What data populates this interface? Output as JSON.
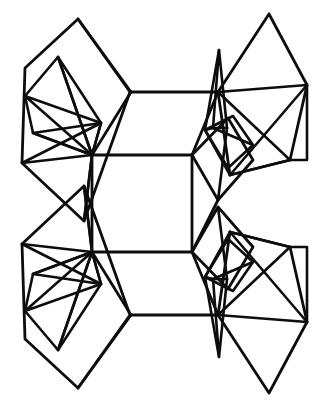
{
  "figure": {
    "kind": "line-drawing",
    "width": 326,
    "height": 407,
    "background_color": "#ffffff",
    "line_color": "#0d0d0d",
    "default_stroke_width": 2.6,
    "symmetry": "two-fold, mirrored about the horizontal mid-line y=203",
    "caption": ""
  },
  "chart_data": {
    "type": "line",
    "title": "",
    "xlabel": "",
    "ylabel": "",
    "grid": false,
    "legend": "none",
    "xlim": [
      0,
      326
    ],
    "ylim": [
      0,
      407
    ],
    "note": "Wireframe drawing: each series is one polyline of the structure, coordinates in image pixel space (y increases downward).",
    "series": [
      {
        "name": "top-left-outer-polyhedron",
        "width": 2.8,
        "points": [
          [
            78,
            19
          ],
          [
            25,
            68
          ],
          [
            22,
            163
          ],
          [
            84,
            221
          ],
          [
            130,
            92
          ],
          [
            78,
            19
          ]
        ]
      },
      {
        "name": "top-left-upper-face",
        "width": 2.8,
        "points": [
          [
            78,
            19
          ],
          [
            131,
            92
          ]
        ]
      },
      {
        "name": "top-left-inner-left-lobe",
        "width": 2.6,
        "points": [
          [
            58,
            57
          ],
          [
            25,
            96
          ],
          [
            33,
            133
          ],
          [
            92,
            155
          ],
          [
            101,
            123
          ],
          [
            58,
            57
          ]
        ]
      },
      {
        "name": "top-left-inner-diagonal-a",
        "width": 2.6,
        "points": [
          [
            25,
            96
          ],
          [
            101,
            123
          ],
          [
            92,
            155
          ],
          [
            25,
            96
          ]
        ]
      },
      {
        "name": "top-left-cross-brace-1",
        "width": 2.6,
        "points": [
          [
            58,
            57
          ],
          [
            92,
            155
          ]
        ]
      },
      {
        "name": "top-left-cross-brace-2",
        "width": 2.6,
        "points": [
          [
            33,
            133
          ],
          [
            101,
            123
          ]
        ]
      },
      {
        "name": "top-left-lower-web-1",
        "width": 2.6,
        "points": [
          [
            22,
            163
          ],
          [
            101,
            123
          ]
        ]
      },
      {
        "name": "top-left-lower-web-2",
        "width": 2.6,
        "points": [
          [
            33,
            133
          ],
          [
            92,
            155
          ],
          [
            84,
            221
          ]
        ]
      },
      {
        "name": "top-left-lower-web-3",
        "width": 2.6,
        "points": [
          [
            22,
            163
          ],
          [
            92,
            155
          ]
        ]
      },
      {
        "name": "top-left-stem",
        "width": 2.6,
        "points": [
          [
            58,
            57
          ],
          [
            92,
            155
          ],
          [
            84,
            221
          ]
        ]
      },
      {
        "name": "central-cavity-top-edge",
        "width": 2.8,
        "points": [
          [
            131,
            92
          ],
          [
            218,
            92
          ]
        ]
      },
      {
        "name": "central-cavity-left-upper",
        "width": 2.8,
        "points": [
          [
            131,
            92
          ],
          [
            92,
            155
          ]
        ]
      },
      {
        "name": "central-cavity-mid-edge",
        "width": 2.8,
        "points": [
          [
            92,
            155
          ],
          [
            192,
            155
          ]
        ]
      },
      {
        "name": "central-cavity-right-upper",
        "width": 2.8,
        "points": [
          [
            218,
            92
          ],
          [
            192,
            155
          ]
        ]
      },
      {
        "name": "central-cavity-left-lower",
        "width": 2.8,
        "points": [
          [
            92,
            252
          ],
          [
            131,
            315
          ]
        ]
      },
      {
        "name": "central-cavity-mid-edge-lower",
        "width": 2.8,
        "points": [
          [
            92,
            252
          ],
          [
            192,
            252
          ]
        ]
      },
      {
        "name": "central-cavity-right-lower",
        "width": 2.8,
        "points": [
          [
            192,
            252
          ],
          [
            218,
            315
          ]
        ]
      },
      {
        "name": "central-cavity-bottom-edge",
        "width": 2.8,
        "points": [
          [
            131,
            315
          ],
          [
            218,
            315
          ]
        ]
      },
      {
        "name": "central-cavity-left-wall",
        "width": 2.8,
        "points": [
          [
            92,
            155
          ],
          [
            92,
            252
          ]
        ]
      },
      {
        "name": "central-cavity-right-wall",
        "width": 2.8,
        "points": [
          [
            192,
            155
          ],
          [
            192,
            252
          ]
        ]
      },
      {
        "name": "top-right-outer-polyhedron",
        "width": 2.8,
        "points": [
          [
            269,
            14
          ],
          [
            218,
            92
          ],
          [
            230,
            175
          ],
          [
            290,
            160
          ],
          [
            307,
            85
          ],
          [
            269,
            14
          ]
        ]
      },
      {
        "name": "top-right-spike",
        "width": 2.6,
        "points": [
          [
            213,
            128
          ],
          [
            219,
            50
          ],
          [
            227,
            128
          ]
        ]
      },
      {
        "name": "top-right-spike-base",
        "width": 2.6,
        "points": [
          [
            213,
            128
          ],
          [
            227,
            128
          ]
        ]
      },
      {
        "name": "top-right-spike-foot",
        "width": 2.6,
        "points": [
          [
            219,
            50
          ],
          [
            205,
            130
          ],
          [
            213,
            128
          ]
        ]
      },
      {
        "name": "top-right-fan-1",
        "width": 2.6,
        "points": [
          [
            218,
            92
          ],
          [
            307,
            85
          ]
        ]
      },
      {
        "name": "top-right-fan-2",
        "width": 2.6,
        "points": [
          [
            218,
            92
          ],
          [
            290,
            160
          ]
        ]
      },
      {
        "name": "top-right-fan-3",
        "width": 2.6,
        "points": [
          [
            307,
            85
          ],
          [
            230,
            175
          ]
        ]
      },
      {
        "name": "top-right-fan-4",
        "width": 2.6,
        "points": [
          [
            307,
            85
          ],
          [
            307,
            160
          ],
          [
            290,
            160
          ]
        ]
      },
      {
        "name": "top-right-inner-rhomb",
        "width": 2.6,
        "points": [
          [
            205,
            130
          ],
          [
            233,
            116
          ],
          [
            253,
            145
          ],
          [
            228,
            168
          ],
          [
            205,
            130
          ]
        ]
      },
      {
        "name": "top-right-inner-brace",
        "width": 2.6,
        "points": [
          [
            213,
            128
          ],
          [
            253,
            145
          ]
        ]
      },
      {
        "name": "top-right-lower-rhomb",
        "width": 2.8,
        "points": [
          [
            192,
            155
          ],
          [
            228,
            118
          ],
          [
            253,
            160
          ],
          [
            218,
            200
          ],
          [
            192,
            155
          ]
        ]
      },
      {
        "name": "top-right-lower-brace-1",
        "width": 2.6,
        "points": [
          [
            227,
            128
          ],
          [
            218,
            200
          ]
        ]
      },
      {
        "name": "top-right-lower-brace-2",
        "width": 2.6,
        "points": [
          [
            205,
            130
          ],
          [
            230,
            175
          ]
        ]
      },
      {
        "name": "top-right-down-leg",
        "width": 2.8,
        "points": [
          [
            218,
            200
          ],
          [
            192,
            252
          ]
        ]
      },
      {
        "name": "top-right-long-diagonal",
        "width": 2.8,
        "points": [
          [
            290,
            160
          ],
          [
            230,
            175
          ]
        ]
      },
      {
        "name": "bottom-left-outer-polyhedron",
        "width": 2.8,
        "points": [
          [
            78,
            388
          ],
          [
            25,
            339
          ],
          [
            22,
            244
          ],
          [
            84,
            186
          ],
          [
            130,
            315
          ],
          [
            78,
            388
          ]
        ]
      },
      {
        "name": "bottom-left-upper-face",
        "width": 2.8,
        "points": [
          [
            78,
            388
          ],
          [
            131,
            315
          ]
        ]
      },
      {
        "name": "bottom-left-inner-left-lobe",
        "width": 2.6,
        "points": [
          [
            58,
            350
          ],
          [
            25,
            311
          ],
          [
            33,
            274
          ],
          [
            92,
            252
          ],
          [
            101,
            284
          ],
          [
            58,
            350
          ]
        ]
      },
      {
        "name": "bottom-left-inner-diagonal-a",
        "width": 2.6,
        "points": [
          [
            25,
            311
          ],
          [
            101,
            284
          ],
          [
            92,
            252
          ],
          [
            25,
            311
          ]
        ]
      },
      {
        "name": "bottom-left-cross-brace-1",
        "width": 2.6,
        "points": [
          [
            58,
            350
          ],
          [
            92,
            252
          ]
        ]
      },
      {
        "name": "bottom-left-cross-brace-2",
        "width": 2.6,
        "points": [
          [
            33,
            274
          ],
          [
            101,
            284
          ]
        ]
      },
      {
        "name": "bottom-left-lower-web-1",
        "width": 2.6,
        "points": [
          [
            22,
            244
          ],
          [
            101,
            284
          ]
        ]
      },
      {
        "name": "bottom-left-lower-web-2",
        "width": 2.6,
        "points": [
          [
            33,
            274
          ],
          [
            92,
            252
          ],
          [
            84,
            186
          ]
        ]
      },
      {
        "name": "bottom-left-lower-web-3",
        "width": 2.6,
        "points": [
          [
            22,
            244
          ],
          [
            92,
            252
          ]
        ]
      },
      {
        "name": "bottom-left-stem",
        "width": 2.6,
        "points": [
          [
            58,
            350
          ],
          [
            92,
            252
          ],
          [
            84,
            186
          ]
        ]
      },
      {
        "name": "bottom-right-outer-polyhedron",
        "width": 2.8,
        "points": [
          [
            269,
            393
          ],
          [
            218,
            315
          ],
          [
            230,
            232
          ],
          [
            290,
            247
          ],
          [
            307,
            322
          ],
          [
            269,
            393
          ]
        ]
      },
      {
        "name": "bottom-right-spike",
        "width": 2.6,
        "points": [
          [
            213,
            279
          ],
          [
            219,
            357
          ],
          [
            227,
            279
          ]
        ]
      },
      {
        "name": "bottom-right-spike-base",
        "width": 2.6,
        "points": [
          [
            213,
            279
          ],
          [
            227,
            279
          ]
        ]
      },
      {
        "name": "bottom-right-spike-foot",
        "width": 2.6,
        "points": [
          [
            219,
            357
          ],
          [
            205,
            277
          ],
          [
            213,
            279
          ]
        ]
      },
      {
        "name": "bottom-right-fan-1",
        "width": 2.6,
        "points": [
          [
            218,
            315
          ],
          [
            307,
            322
          ]
        ]
      },
      {
        "name": "bottom-right-fan-2",
        "width": 2.6,
        "points": [
          [
            218,
            315
          ],
          [
            290,
            247
          ]
        ]
      },
      {
        "name": "bottom-right-fan-3",
        "width": 2.6,
        "points": [
          [
            307,
            322
          ],
          [
            230,
            232
          ]
        ]
      },
      {
        "name": "bottom-right-fan-4",
        "width": 2.6,
        "points": [
          [
            307,
            322
          ],
          [
            307,
            247
          ],
          [
            290,
            247
          ]
        ]
      },
      {
        "name": "bottom-right-inner-rhomb",
        "width": 2.6,
        "points": [
          [
            205,
            277
          ],
          [
            233,
            291
          ],
          [
            253,
            262
          ],
          [
            228,
            239
          ],
          [
            205,
            277
          ]
        ]
      },
      {
        "name": "bottom-right-inner-brace",
        "width": 2.6,
        "points": [
          [
            213,
            279
          ],
          [
            253,
            262
          ]
        ]
      },
      {
        "name": "bottom-right-lower-rhomb",
        "width": 2.8,
        "points": [
          [
            192,
            252
          ],
          [
            228,
            289
          ],
          [
            253,
            247
          ],
          [
            218,
            207
          ],
          [
            192,
            252
          ]
        ]
      },
      {
        "name": "bottom-right-lower-brace-1",
        "width": 2.6,
        "points": [
          [
            227,
            279
          ],
          [
            218,
            207
          ]
        ]
      },
      {
        "name": "bottom-right-lower-brace-2",
        "width": 2.6,
        "points": [
          [
            205,
            277
          ],
          [
            230,
            232
          ]
        ]
      },
      {
        "name": "bottom-right-long-diagonal",
        "width": 2.8,
        "points": [
          [
            290,
            247
          ],
          [
            230,
            232
          ]
        ]
      }
    ]
  }
}
